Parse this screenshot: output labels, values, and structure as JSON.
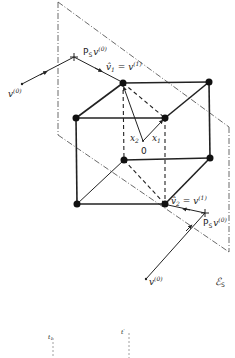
{
  "diagram": {
    "type": "projection-onto-subspace-cube",
    "labels": {
      "v0_top": "v",
      "v0_top_sup": "(0)",
      "ps_top": "P",
      "ps_top_sub": "S",
      "ps_top_v": "v",
      "ps_top_sup": "(0)",
      "vhat1": "v̂",
      "vhat1_sub": "1",
      "vhat1_eq": " = v",
      "vhat1_sup": "(1)",
      "x1": "x",
      "x1_sub": "1",
      "x2": "x",
      "x2_sub": "2",
      "origin": "0",
      "vhat2": "v̂",
      "vhat2_sub": "2",
      "vhat2_eq": " = v",
      "vhat2_sup": "(1)",
      "ps_bottom": "P",
      "ps_bottom_sub": "S",
      "ps_bottom_v": "v",
      "ps_bottom_sup": "(0)",
      "v0_bottom": "v",
      "v0_bottom_sup": "(0)",
      "subspace": "ℰ",
      "subspace_sub": "S",
      "t1": "t",
      "t1_sub": "1",
      "t2": "t",
      "t2_sup": "'"
    },
    "colors": {
      "line": "#222222",
      "plane": "#444444",
      "background": "#ffffff"
    }
  }
}
